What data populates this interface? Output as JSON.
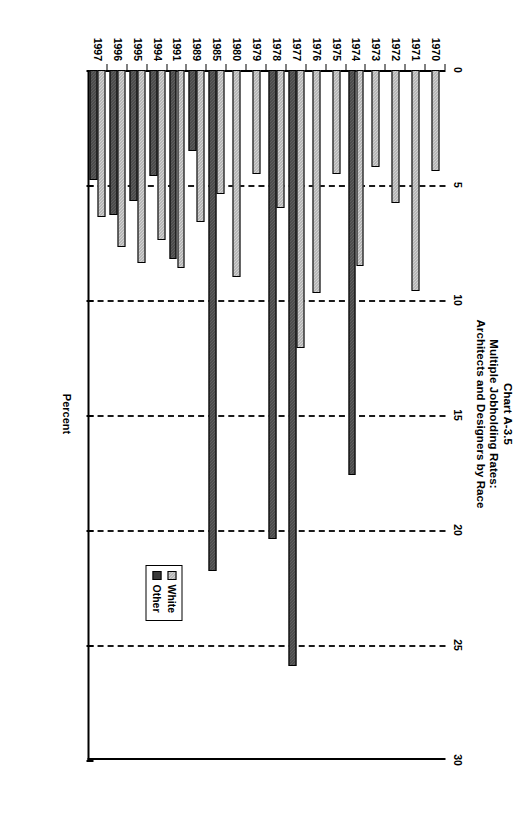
{
  "chart_data": {
    "type": "bar",
    "orientation": "horizontal",
    "title": "Chart A-3.5\nMultiple Jobholding Rates:\nArchitects and Designers by Race",
    "title_lines": [
      "Chart A-3.5",
      "Multiple Jobholding Rates:",
      "Architects and Designers by Race"
    ],
    "xlabel": "Percent",
    "ylabel": "",
    "xlim": [
      0,
      30
    ],
    "xticks": [
      0,
      5,
      10,
      15,
      20,
      25,
      30
    ],
    "xtick_labels": [
      "0",
      "5",
      "10",
      "15",
      "20",
      "25",
      "30"
    ],
    "grid": true,
    "grid_style": "dashed vertical",
    "legend_position": "lower right inside plot",
    "categories": [
      "1970",
      "1971",
      "1972",
      "1973",
      "1974",
      "1975",
      "1976",
      "1977",
      "1978",
      "1979",
      "1980",
      "1985",
      "1989",
      "1991",
      "1994",
      "1995",
      "1996",
      "1997"
    ],
    "series": [
      {
        "name": "White",
        "color": "#9c9c9c",
        "values": [
          4.4,
          9.6,
          5.8,
          4.2,
          8.5,
          4.5,
          9.7,
          12.1,
          6.0,
          4.5,
          9.0,
          5.4,
          6.6,
          8.6,
          7.4,
          8.4,
          7.7,
          6.4
        ]
      },
      {
        "name": "Other",
        "color": "#3a3a3a",
        "values": [
          null,
          null,
          null,
          null,
          17.6,
          null,
          null,
          25.9,
          20.4,
          null,
          null,
          21.8,
          3.5,
          8.2,
          4.6,
          5.7,
          6.3,
          4.8
        ]
      }
    ]
  },
  "legend": {
    "entries": [
      {
        "label": "White"
      },
      {
        "label": "Other"
      }
    ]
  }
}
